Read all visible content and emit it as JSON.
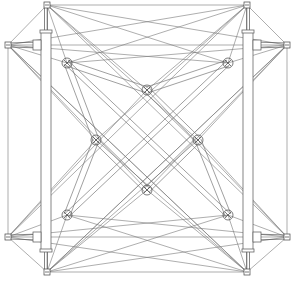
{
  "diagram": {
    "type": "tensegrity-structure-line-drawing",
    "stroke_color": "#6b6b6b",
    "dark_color": "#3a3a3a",
    "background": "#ffffff",
    "hubs": [
      {
        "id": "top-left",
        "x": 47,
        "y": 5
      },
      {
        "id": "top-right",
        "x": 247,
        "y": 5
      },
      {
        "id": "bottom-left",
        "x": 47,
        "y": 272
      },
      {
        "id": "bottom-right",
        "x": 247,
        "y": 272
      },
      {
        "id": "left-upper",
        "x": 8,
        "y": 45
      },
      {
        "id": "left-lower",
        "x": 8,
        "y": 237
      },
      {
        "id": "right-upper",
        "x": 287,
        "y": 45
      },
      {
        "id": "right-lower",
        "x": 287,
        "y": 237
      }
    ],
    "inner_nodes": [
      {
        "id": "ul",
        "x": 67,
        "y": 63
      },
      {
        "id": "ur",
        "x": 228,
        "y": 63
      },
      {
        "id": "ll",
        "x": 67,
        "y": 215
      },
      {
        "id": "lr",
        "x": 228,
        "y": 215
      },
      {
        "id": "diamond-top",
        "x": 147,
        "y": 90
      },
      {
        "id": "diamond-left",
        "x": 96,
        "y": 140
      },
      {
        "id": "diamond-right",
        "x": 198,
        "y": 140
      },
      {
        "id": "diamond-bottom",
        "x": 147,
        "y": 190
      }
    ],
    "struts": [
      {
        "id": "left-vertical",
        "x": 41,
        "y": 32,
        "w": 10,
        "h": 218
      },
      {
        "id": "right-vertical",
        "x": 243,
        "y": 32,
        "w": 10,
        "h": 218
      }
    ]
  }
}
